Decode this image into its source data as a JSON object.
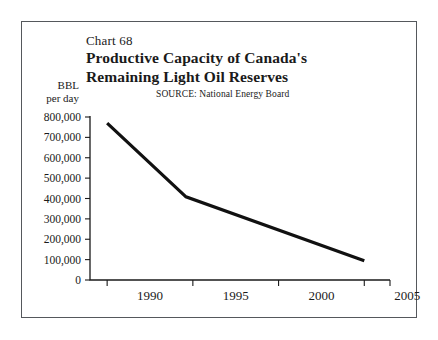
{
  "figure": {
    "chart_number_label": "Chart 68",
    "title_line_1": "Productive Capacity of Canada's",
    "title_line_2": "Remaining Light Oil Reserves",
    "source_note": "SOURCE:  National Energy Board",
    "unit_caption_line_1": "BBL",
    "unit_caption_line_2": "per day",
    "frame_color": "#55585c",
    "background_color": "#ffffff",
    "text_color": "#1a1a1a"
  },
  "chart_data": {
    "type": "line",
    "title": "Productive Capacity of Canada's Remaining Light Oil Reserves",
    "subtitle": "Chart 68",
    "annotations": [
      "SOURCE:  National Energy Board"
    ],
    "xlabel": "",
    "ylabel": "BBL per day",
    "grid": false,
    "legend": "none",
    "xlim": [
      1989,
      2006.5
    ],
    "ylim": [
      0,
      800000
    ],
    "xticks": [
      1990,
      1995,
      2000,
      2005
    ],
    "xtick_labels": [
      "1990",
      "1995",
      "2000",
      "2005"
    ],
    "yticks": [
      0,
      100000,
      200000,
      300000,
      400000,
      500000,
      600000,
      700000,
      800000
    ],
    "ytick_labels": [
      "0",
      "100,000",
      "200,000",
      "300,000",
      "400,000",
      "500,000",
      "600,000",
      "700,000",
      "800,000"
    ],
    "series": [
      {
        "name": "Productive capacity",
        "color": "#111111",
        "x": [
          1990.0,
          1994.6,
          2005.0
        ],
        "y": [
          770000,
          408000,
          95000
        ],
        "points": [
          {
            "x": 1990.0,
            "y": 770000
          },
          {
            "x": 1994.6,
            "y": 408000
          },
          {
            "x": 2005.0,
            "y": 95000
          }
        ]
      }
    ]
  }
}
